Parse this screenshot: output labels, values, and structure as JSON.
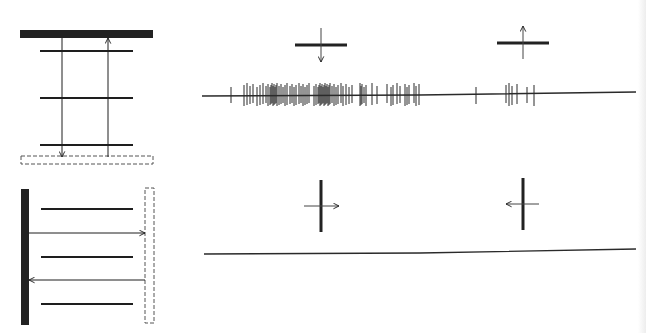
{
  "figure": {
    "colors": {
      "ink": "#1e1e1e",
      "bar": "#222222",
      "trace": "#2a2a2a",
      "background": "#ffffff"
    }
  },
  "top_row": {
    "schematic": {
      "orientation": "horizontal",
      "solid_bar": {
        "x": 20,
        "y": 30,
        "w": 133,
        "h": 8
      },
      "dashed_bar": {
        "x": 21,
        "y": 156,
        "w": 132,
        "h": 8
      },
      "lines_y": [
        51,
        98,
        145
      ],
      "lines_x": [
        40,
        133
      ],
      "arrow_down_x": 62,
      "arrow_up_x": 108
    },
    "stimuli": [
      {
        "id": "down",
        "cx": 321,
        "cy": 45,
        "bar_len": 52,
        "direction": "down"
      },
      {
        "id": "up",
        "cx": 523,
        "cy": 43,
        "bar_len": 52,
        "direction": "up"
      }
    ],
    "trace": {
      "baseline_y": 95,
      "x_start": 202,
      "x_end": 636,
      "spikes_x": [
        231,
        244,
        247,
        250,
        253,
        257,
        260,
        263,
        266,
        268,
        270,
        271,
        272,
        273,
        274,
        275,
        276,
        277,
        279,
        281,
        283,
        285,
        287,
        290,
        292,
        294,
        296,
        299,
        301,
        303,
        305,
        307,
        309,
        314,
        316,
        318,
        319,
        320,
        321,
        322,
        323,
        324,
        325,
        326,
        327,
        328,
        329,
        330,
        332,
        334,
        336,
        338,
        341,
        343,
        346,
        349,
        352,
        360,
        361,
        362,
        364,
        366,
        372,
        377,
        387,
        391,
        393,
        397,
        400,
        405,
        407,
        409,
        414,
        416,
        419,
        476,
        506,
        509,
        512,
        517,
        527,
        534
      ]
    }
  },
  "bottom_row": {
    "schematic": {
      "orientation": "vertical",
      "solid_bar": {
        "x": 21,
        "y": 189,
        "w": 8,
        "h": 136
      },
      "dashed_bar": {
        "x": 145,
        "y": 188,
        "w": 9,
        "h": 135
      },
      "lines_x": [
        41,
        133
      ],
      "lines_y": [
        209,
        257,
        304
      ],
      "arrow_right_y": 233,
      "arrow_left_y": 280
    },
    "stimuli": [
      {
        "id": "right",
        "cx": 321,
        "cy": 206,
        "bar_len": 52,
        "direction": "right"
      },
      {
        "id": "left",
        "cx": 523,
        "cy": 204,
        "bar_len": 52,
        "direction": "left"
      }
    ],
    "trace": {
      "baseline_y": 253,
      "x_start": 204,
      "x_end": 636,
      "spikes_x": []
    }
  }
}
